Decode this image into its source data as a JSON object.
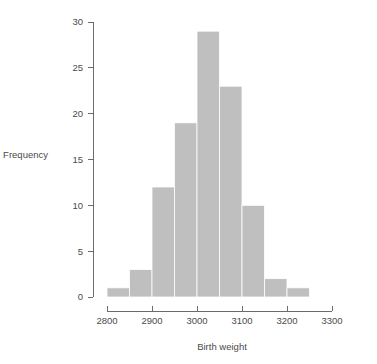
{
  "chart_data": {
    "type": "bar",
    "title": "",
    "subtitle": "",
    "xlabel": "Birth weight",
    "ylabel": "Frequency",
    "categories": [
      "2800-2850",
      "2850-2900",
      "2900-2950",
      "2950-3000",
      "3000-3050",
      "3050-3100",
      "3100-3150",
      "3150-3200",
      "3200-3250"
    ],
    "bin_starts": [
      2800,
      2850,
      2900,
      2950,
      3000,
      3050,
      3100,
      3150,
      3200
    ],
    "bin_width": 50,
    "values": [
      1,
      3,
      12,
      19,
      29,
      23,
      10,
      2,
      1
    ],
    "xlim": [
      2800,
      3300
    ],
    "ylim": [
      0,
      30
    ],
    "xticks": [
      2800,
      2900,
      3000,
      3100,
      3200,
      3300
    ],
    "xtick_labels": [
      "2800",
      "2900",
      "3000",
      "3100",
      "3200",
      "3300"
    ],
    "yticks": [
      0,
      5,
      10,
      15,
      20,
      25,
      30
    ],
    "ytick_labels": [
      "0",
      "5",
      "10",
      "15",
      "20",
      "25",
      "30"
    ],
    "grid": false,
    "legend": false,
    "legend_position": "none",
    "bar_color": "#bfbfbf",
    "bar_edge_color": "#ffffff",
    "axis_color": "#6b6b6b",
    "text_color": "#4a4a4a",
    "background_color": "#ffffff"
  }
}
